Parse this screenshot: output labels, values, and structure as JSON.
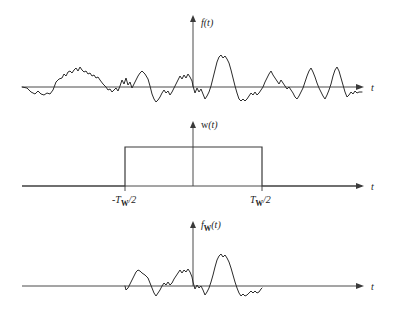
{
  "figure": {
    "title": "",
    "background_color": "#ffffff",
    "line_color": "#2b2b2b",
    "axis_color": "#4a4a4a",
    "width": 394,
    "height": 318
  },
  "panels": [
    {
      "id": "panel-signal",
      "y_label": "f(t)",
      "y_label_main": "f",
      "y_label_sub": "",
      "y_label_tail": "(t)",
      "x_label": "t",
      "baseline_y": 87,
      "origin_x": 193,
      "axis_x_start": 22,
      "axis_x_end": 362,
      "axis_y_top": 18
    },
    {
      "id": "panel-window",
      "y_label": "w(t)",
      "y_label_main": "w",
      "y_label_sub": "",
      "y_label_tail": "(t)",
      "x_label": "t",
      "baseline_y": 186,
      "origin_x": 193,
      "axis_x_start": 22,
      "axis_x_end": 362,
      "axis_y_top": 124,
      "tick_labels": [
        {
          "text_prefix": "-T",
          "text_sub": "W",
          "text_suffix": "/2",
          "x": 125
        },
        {
          "text_prefix": "T",
          "text_sub": "W",
          "text_suffix": "/2",
          "x": 262
        }
      ],
      "window_left_x": 125,
      "window_right_x": 262,
      "window_top_y": 147,
      "window_amplitude_label": ""
    },
    {
      "id": "panel-windowed-signal",
      "y_label": "fW(t)",
      "y_label_main": "f",
      "y_label_sub": "W",
      "y_label_tail": "(t)",
      "x_label": "t",
      "baseline_y": 286,
      "origin_x": 193,
      "axis_x_start": 22,
      "axis_x_end": 362,
      "axis_y_top": 224
    }
  ],
  "chart_data": {
    "type": "line",
    "title": "",
    "xlabel": "t",
    "ylabel": "f(t)",
    "grid": false,
    "legend": false,
    "series": [
      {
        "name": "f(t)",
        "panel": "panel-signal",
        "points": [
          [
            22,
            87
          ],
          [
            27,
            88
          ],
          [
            31,
            92
          ],
          [
            35,
            94
          ],
          [
            38,
            91
          ],
          [
            41,
            94
          ],
          [
            44,
            95
          ],
          [
            47,
            93
          ],
          [
            50,
            94
          ],
          [
            53,
            90
          ],
          [
            56,
            82
          ],
          [
            59,
            79
          ],
          [
            62,
            78
          ],
          [
            64,
            74
          ],
          [
            66,
            76
          ],
          [
            68,
            72
          ],
          [
            70,
            71
          ],
          [
            72,
            73
          ],
          [
            74,
            70
          ],
          [
            76,
            68
          ],
          [
            78,
            71
          ],
          [
            80,
            67
          ],
          [
            82,
            70
          ],
          [
            84,
            72
          ],
          [
            86,
            71
          ],
          [
            88,
            74
          ],
          [
            90,
            73
          ],
          [
            92,
            76
          ],
          [
            94,
            75
          ],
          [
            96,
            78
          ],
          [
            98,
            77
          ],
          [
            100,
            80
          ],
          [
            103,
            84
          ],
          [
            106,
            87
          ],
          [
            108,
            90
          ],
          [
            110,
            89
          ],
          [
            112,
            92
          ],
          [
            114,
            90
          ],
          [
            116,
            88
          ],
          [
            118,
            91
          ],
          [
            120,
            86
          ],
          [
            122,
            80
          ],
          [
            124,
            84
          ],
          [
            126,
            78
          ],
          [
            128,
            85
          ],
          [
            130,
            82
          ],
          [
            132,
            88
          ],
          [
            134,
            84
          ],
          [
            136,
            80
          ],
          [
            138,
            76
          ],
          [
            140,
            73
          ],
          [
            142,
            71
          ],
          [
            145,
            74
          ],
          [
            148,
            79
          ],
          [
            150,
            86
          ],
          [
            152,
            94
          ],
          [
            154,
            99
          ],
          [
            156,
            102
          ],
          [
            158,
            100
          ],
          [
            160,
            97
          ],
          [
            162,
            93
          ],
          [
            164,
            90
          ],
          [
            166,
            93
          ],
          [
            168,
            91
          ],
          [
            170,
            95
          ],
          [
            172,
            92
          ],
          [
            174,
            88
          ],
          [
            176,
            84
          ],
          [
            178,
            80
          ],
          [
            180,
            76
          ],
          [
            182,
            79
          ],
          [
            184,
            75
          ],
          [
            186,
            78
          ],
          [
            188,
            74
          ],
          [
            190,
            77
          ],
          [
            192,
            81
          ],
          [
            193,
            86
          ],
          [
            195,
            93
          ],
          [
            197,
            88
          ],
          [
            199,
            92
          ],
          [
            201,
            89
          ],
          [
            203,
            94
          ],
          [
            205,
            99
          ],
          [
            207,
            96
          ],
          [
            209,
            92
          ],
          [
            211,
            86
          ],
          [
            213,
            78
          ],
          [
            215,
            70
          ],
          [
            217,
            62
          ],
          [
            219,
            57
          ],
          [
            221,
            55
          ],
          [
            223,
            58
          ],
          [
            225,
            56
          ],
          [
            227,
            59
          ],
          [
            229,
            63
          ],
          [
            231,
            70
          ],
          [
            233,
            78
          ],
          [
            235,
            86
          ],
          [
            237,
            93
          ],
          [
            239,
            99
          ],
          [
            241,
            101
          ],
          [
            243,
            99
          ],
          [
            245,
            101
          ],
          [
            247,
            99
          ],
          [
            249,
            96
          ],
          [
            251,
            93
          ],
          [
            253,
            95
          ],
          [
            255,
            92
          ],
          [
            257,
            95
          ],
          [
            259,
            93
          ],
          [
            261,
            90
          ],
          [
            263,
            87
          ],
          [
            265,
            82
          ],
          [
            267,
            78
          ],
          [
            269,
            74
          ],
          [
            271,
            71
          ],
          [
            273,
            75
          ],
          [
            275,
            78
          ],
          [
            277,
            81
          ],
          [
            279,
            84
          ],
          [
            281,
            80
          ],
          [
            283,
            83
          ],
          [
            285,
            86
          ],
          [
            287,
            89
          ],
          [
            289,
            87
          ],
          [
            291,
            90
          ],
          [
            293,
            93
          ],
          [
            295,
            97
          ],
          [
            297,
            99
          ],
          [
            299,
            96
          ],
          [
            301,
            92
          ],
          [
            303,
            88
          ],
          [
            305,
            82
          ],
          [
            307,
            76
          ],
          [
            309,
            71
          ],
          [
            311,
            68
          ],
          [
            313,
            72
          ],
          [
            315,
            77
          ],
          [
            317,
            83
          ],
          [
            319,
            88
          ],
          [
            321,
            92
          ],
          [
            323,
            96
          ],
          [
            325,
            99
          ],
          [
            327,
            95
          ],
          [
            329,
            90
          ],
          [
            331,
            84
          ],
          [
            333,
            76
          ],
          [
            335,
            70
          ],
          [
            337,
            67
          ],
          [
            339,
            71
          ],
          [
            341,
            78
          ],
          [
            343,
            85
          ],
          [
            345,
            92
          ],
          [
            347,
            97
          ],
          [
            349,
            95
          ],
          [
            351,
            92
          ],
          [
            353,
            94
          ],
          [
            355,
            91
          ],
          [
            357,
            93
          ],
          [
            359,
            92
          ],
          [
            362,
            92
          ]
        ]
      },
      {
        "name": "w(t)",
        "panel": "panel-window",
        "points": [
          [
            22,
            186
          ],
          [
            125,
            186
          ],
          [
            125,
            147
          ],
          [
            262,
            147
          ],
          [
            262,
            186
          ],
          [
            362,
            186
          ]
        ]
      },
      {
        "name": "fW(t)",
        "panel": "panel-windowed-signal",
        "points": [
          [
            125,
            286
          ],
          [
            126,
            290
          ],
          [
            128,
            288
          ],
          [
            130,
            284
          ],
          [
            132,
            280
          ],
          [
            134,
            276
          ],
          [
            136,
            272
          ],
          [
            138,
            270
          ],
          [
            140,
            271
          ],
          [
            142,
            273
          ],
          [
            145,
            275
          ],
          [
            148,
            278
          ],
          [
            150,
            283
          ],
          [
            152,
            288
          ],
          [
            154,
            293
          ],
          [
            156,
            296
          ],
          [
            158,
            293
          ],
          [
            160,
            290
          ],
          [
            162,
            286
          ],
          [
            164,
            283
          ],
          [
            166,
            285
          ],
          [
            168,
            282
          ],
          [
            170,
            285
          ],
          [
            172,
            283
          ],
          [
            174,
            279
          ],
          [
            176,
            276
          ],
          [
            178,
            273
          ],
          [
            180,
            270
          ],
          [
            182,
            273
          ],
          [
            184,
            270
          ],
          [
            186,
            272
          ],
          [
            188,
            269
          ],
          [
            190,
            272
          ],
          [
            192,
            277
          ],
          [
            193,
            282
          ],
          [
            195,
            289
          ],
          [
            197,
            285
          ],
          [
            199,
            288
          ],
          [
            201,
            286
          ],
          [
            203,
            290
          ],
          [
            205,
            295
          ],
          [
            207,
            292
          ],
          [
            209,
            288
          ],
          [
            211,
            282
          ],
          [
            213,
            275
          ],
          [
            215,
            267
          ],
          [
            217,
            260
          ],
          [
            219,
            256
          ],
          [
            221,
            254
          ],
          [
            223,
            257
          ],
          [
            225,
            255
          ],
          [
            227,
            258
          ],
          [
            229,
            262
          ],
          [
            231,
            268
          ],
          [
            233,
            275
          ],
          [
            235,
            282
          ],
          [
            237,
            288
          ],
          [
            239,
            293
          ],
          [
            241,
            296
          ],
          [
            243,
            294
          ],
          [
            245,
            296
          ],
          [
            247,
            295
          ],
          [
            249,
            293
          ],
          [
            251,
            291
          ],
          [
            253,
            293
          ],
          [
            255,
            291
          ],
          [
            257,
            293
          ],
          [
            259,
            292
          ],
          [
            261,
            289
          ],
          [
            262,
            288
          ]
        ]
      }
    ]
  }
}
